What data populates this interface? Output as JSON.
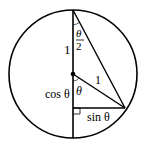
{
  "diagram": {
    "labels": {
      "upper_radius": "1",
      "half_angle_num": "θ",
      "half_angle_den": "2",
      "radius_label": "1",
      "cos_label": "cos θ",
      "angle_label": "θ",
      "sin_label": "sin θ"
    },
    "colors": {
      "stroke": "#000000",
      "background": "#ffffff"
    }
  }
}
